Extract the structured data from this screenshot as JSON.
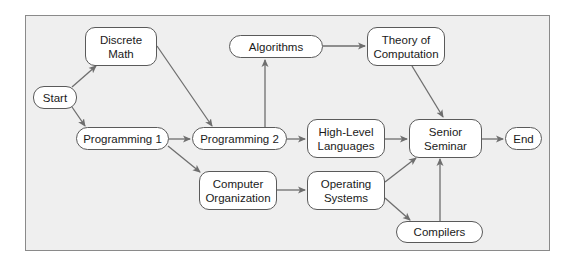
{
  "diagram": {
    "type": "flowchart",
    "colors": {
      "background": "#efefef",
      "node_fill": "#ffffff",
      "node_border": "#5a5a5a",
      "edge": "#6e6e6e"
    },
    "nodes": [
      {
        "id": "start",
        "label": "Start"
      },
      {
        "id": "discrete",
        "label": "Discrete\nMath"
      },
      {
        "id": "prog1",
        "label": "Programming 1"
      },
      {
        "id": "prog2",
        "label": "Programming 2"
      },
      {
        "id": "algorithms",
        "label": "Algorithms"
      },
      {
        "id": "theory",
        "label": "Theory of\nComputation"
      },
      {
        "id": "highlevel",
        "label": "High-Level\nLanguages"
      },
      {
        "id": "senior",
        "label": "Senior\nSeminar"
      },
      {
        "id": "end",
        "label": "End"
      },
      {
        "id": "comporg",
        "label": "Computer\nOrganization"
      },
      {
        "id": "opsys",
        "label": "Operating\nSystems"
      },
      {
        "id": "compilers",
        "label": "Compilers"
      }
    ],
    "edges": [
      {
        "from": "start",
        "to": "discrete"
      },
      {
        "from": "start",
        "to": "prog1"
      },
      {
        "from": "discrete",
        "to": "prog2"
      },
      {
        "from": "prog1",
        "to": "prog2"
      },
      {
        "from": "prog1",
        "to": "comporg"
      },
      {
        "from": "prog2",
        "to": "algorithms"
      },
      {
        "from": "prog2",
        "to": "highlevel"
      },
      {
        "from": "algorithms",
        "to": "theory"
      },
      {
        "from": "theory",
        "to": "senior"
      },
      {
        "from": "highlevel",
        "to": "senior"
      },
      {
        "from": "comporg",
        "to": "opsys"
      },
      {
        "from": "opsys",
        "to": "senior"
      },
      {
        "from": "opsys",
        "to": "compilers"
      },
      {
        "from": "compilers",
        "to": "senior"
      },
      {
        "from": "senior",
        "to": "end"
      }
    ]
  }
}
